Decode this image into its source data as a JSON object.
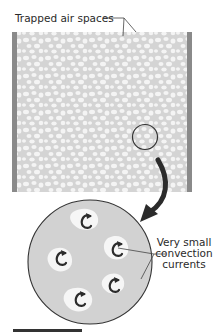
{
  "diagram": {
    "title_label": "Trapped air spaces",
    "convection_label": {
      "line1": "Very small",
      "line2": "convection",
      "line3": "currents"
    },
    "colors": {
      "foam_fill": "#d4d4d4",
      "air_bubble": "#f4f4f4",
      "wall": "#8a8a8a",
      "outline": "#333333",
      "arrow": "#2b2b2b",
      "text": "#2a2a2a"
    },
    "components": {
      "left_wall": "wall panel",
      "right_wall": "wall panel",
      "insulation": "foam with trapped air spaces",
      "magnifier_circle": "zoom region",
      "magnified_view": "enlarged foam with air pockets",
      "air_pockets_in_magnified_view": 5
    }
  }
}
